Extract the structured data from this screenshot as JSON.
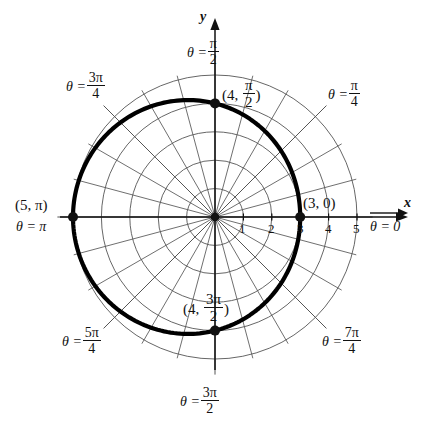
{
  "figure": {
    "kind": "polar-plot",
    "caption_present": false,
    "background": "#ffffff",
    "ink": "#111111",
    "grid_color": "#555555",
    "curve_color": "#000000"
  },
  "axes": {
    "x_label": "x",
    "y_label": "y",
    "origin": {
      "x": 215,
      "y": 217
    },
    "unit_px": 28.4,
    "x_tick_labels": [
      "1",
      "2",
      "3",
      "4",
      "5"
    ],
    "x_tick_values": [
      1,
      2,
      3,
      4,
      5
    ]
  },
  "theta_labels": [
    {
      "id": "theta-0",
      "text": "θ = 0",
      "numerator": "",
      "denominator": "",
      "angle_deg": 0
    },
    {
      "id": "theta-pi-4",
      "text": "θ =",
      "numerator": "π",
      "denominator": "4",
      "angle_deg": 45
    },
    {
      "id": "theta-pi-2",
      "text": "θ =",
      "numerator": "π",
      "denominator": "2",
      "angle_deg": 90
    },
    {
      "id": "theta-3pi-4",
      "text": "θ =",
      "numerator": "3π",
      "denominator": "4",
      "angle_deg": 135
    },
    {
      "id": "theta-pi",
      "text": "θ = π",
      "numerator": "",
      "denominator": "",
      "angle_deg": 180
    },
    {
      "id": "theta-5pi-4",
      "text": "θ =",
      "numerator": "5π",
      "denominator": "4",
      "angle_deg": 225
    },
    {
      "id": "theta-3pi-2",
      "text": "θ =",
      "numerator": "3π",
      "denominator": "2",
      "angle_deg": 270
    },
    {
      "id": "theta-7pi-4",
      "text": "θ =",
      "numerator": "7π",
      "denominator": "4",
      "angle_deg": 315
    }
  ],
  "point_labels": [
    {
      "id": "pt-3-0",
      "prefix": "(3, 0)",
      "open": "",
      "numerator": "",
      "denominator": "",
      "close": "",
      "r": 3,
      "theta_deg": 0
    },
    {
      "id": "pt-4-pi-2",
      "prefix": "",
      "open": "(4, ",
      "numerator": "π",
      "denominator": "2",
      "close": ")",
      "r": 4,
      "theta_deg": 90
    },
    {
      "id": "pt-5-pi",
      "prefix": "(5, π)",
      "open": "",
      "numerator": "",
      "denominator": "",
      "close": "",
      "r": 5,
      "theta_deg": 180
    },
    {
      "id": "pt-4-3pi-2",
      "prefix": "",
      "open": "(4, ",
      "numerator": "3π",
      "denominator": "2",
      "close": ")",
      "r": 4,
      "theta_deg": 270
    }
  ],
  "chart_data": {
    "type": "line",
    "coordinate_system": "polar",
    "title": "",
    "xlabel": "x",
    "ylabel": "y",
    "equation": "r = 4 − cos θ",
    "grid": true,
    "legend": "none",
    "r_axis_ticks": [
      1,
      2,
      3,
      4,
      5
    ],
    "r_max": 5,
    "theta_grid_step_deg": 15,
    "theta_tick_labels": [
      "θ = 0",
      "θ = π/4",
      "θ = π/2",
      "θ = 3π/4",
      "θ = π",
      "θ = 5π/4",
      "θ = 3π/2",
      "θ = 7π/4"
    ],
    "marked_points": [
      {
        "label": "(3, 0)",
        "r": 3,
        "theta_deg": 0
      },
      {
        "label": "(4, π/2)",
        "r": 4,
        "theta_deg": 90
      },
      {
        "label": "(5, π)",
        "r": 5,
        "theta_deg": 180
      },
      {
        "label": "(4, 3π/2)",
        "r": 4,
        "theta_deg": 270
      }
    ],
    "series": [
      {
        "name": "r = 4 - cos(theta)",
        "theta_deg": [
          0,
          15,
          30,
          45,
          60,
          75,
          90,
          105,
          120,
          135,
          150,
          165,
          180,
          195,
          210,
          225,
          240,
          255,
          270,
          285,
          300,
          315,
          330,
          345,
          360
        ],
        "r": [
          3.0,
          3.03,
          3.13,
          3.29,
          3.5,
          3.74,
          4.0,
          4.26,
          4.5,
          4.71,
          4.87,
          4.97,
          5.0,
          4.97,
          4.87,
          4.71,
          4.5,
          4.26,
          4.0,
          3.74,
          3.5,
          3.29,
          3.13,
          3.03,
          3.0
        ]
      }
    ]
  }
}
